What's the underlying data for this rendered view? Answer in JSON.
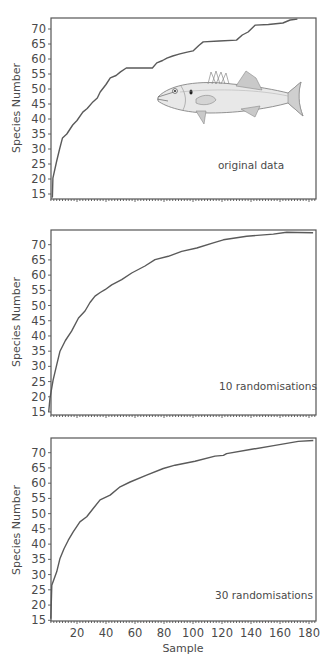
{
  "chart_data": [
    {
      "type": "line",
      "title": "",
      "annotation": "original data",
      "xlabel": "",
      "ylabel": "Species Number",
      "xlim": [
        0,
        185
      ],
      "ylim": [
        13.3,
        73.7
      ],
      "yticks": [
        15,
        20,
        25,
        30,
        35,
        40,
        45,
        50,
        55,
        60,
        65,
        70
      ],
      "xticks": [],
      "grid": false,
      "series": [
        {
          "name": "original data",
          "x": [
            2.5,
            3,
            3.4,
            6,
            8,
            10,
            13,
            17,
            20,
            24,
            27,
            31,
            34,
            36,
            40,
            43,
            47,
            50,
            54,
            60,
            66,
            72,
            75,
            79,
            82,
            86,
            91,
            96,
            100,
            104,
            107,
            118,
            130,
            134,
            138,
            143,
            152,
            162,
            167,
            172
          ],
          "y": [
            14,
            14,
            20.3,
            26,
            30,
            33.7,
            35,
            38,
            39.5,
            42.3,
            43.5,
            45.7,
            47,
            49,
            51.5,
            53.7,
            54.5,
            55.7,
            57,
            57,
            57,
            57,
            58.7,
            59.5,
            60.3,
            61,
            61.7,
            62.3,
            62.7,
            64.5,
            65.7,
            66,
            66.3,
            68,
            69,
            71.3,
            71.5,
            72,
            73,
            73.3
          ]
        }
      ],
      "illustration": "sea-bass-fish"
    },
    {
      "type": "line",
      "title": "",
      "annotation": "10 randomisations",
      "xlabel": "",
      "ylabel": "Species Number",
      "xlim": [
        0,
        185
      ],
      "ylim": [
        13.3,
        74
      ],
      "yticks": [
        15,
        20,
        25,
        30,
        35,
        40,
        45,
        50,
        55,
        60,
        65,
        70
      ],
      "xticks": [],
      "grid": false,
      "series": [
        {
          "name": "10 randomisations",
          "x": [
            0.5,
            1.4,
            3.5,
            6,
            8.3,
            12,
            16.3,
            21,
            25.5,
            29,
            32.4,
            36,
            39.3,
            43.9,
            50.8,
            57.7,
            66.9,
            73.8,
            83,
            92.2,
            102.6,
            114,
            121,
            137,
            155.4,
            164.6,
            172,
            182.8
          ],
          "y": [
            15,
            19.6,
            25.5,
            30.5,
            35,
            38.5,
            41.6,
            45.9,
            48.2,
            51,
            53.1,
            54.3,
            55.2,
            56.8,
            58.5,
            60.7,
            63,
            65.1,
            66.2,
            67.8,
            68.9,
            70.6,
            71.6,
            72.8,
            73.5,
            74.1,
            74,
            73.9
          ]
        }
      ]
    },
    {
      "type": "line",
      "title": "",
      "annotation": "30 randomisations",
      "xlabel": "Sample",
      "ylabel": "Species Number",
      "xlim": [
        0,
        185
      ],
      "ylim": [
        14.7,
        74.5
      ],
      "yticks": [
        15,
        20,
        25,
        30,
        35,
        40,
        45,
        50,
        55,
        60,
        65,
        70
      ],
      "xticks": [
        20,
        40,
        60,
        80,
        100,
        120,
        140,
        160,
        180
      ],
      "grid": false,
      "series": [
        {
          "name": "30 randomisations",
          "x": [
            1.9,
            2.6,
            6,
            8.3,
            11,
            14,
            17.4,
            22,
            26.7,
            31.2,
            35.9,
            42.8,
            49.7,
            56.6,
            68,
            79.5,
            87.6,
            101.4,
            115.2,
            121,
            123.2,
            140.5,
            156.6,
            172.6,
            183
          ],
          "y": [
            15.5,
            26.5,
            30.9,
            35.3,
            38.5,
            41.3,
            44,
            47.3,
            49,
            51.7,
            54.5,
            56.1,
            58.8,
            60.4,
            62.6,
            64.8,
            65.9,
            67.2,
            68.9,
            69.1,
            69.7,
            71.1,
            72.4,
            73.7,
            74
          ]
        }
      ]
    }
  ],
  "panels": [
    {
      "annotation": "original data",
      "ylabel": "Species Number"
    },
    {
      "annotation": "10 randomisations",
      "ylabel": "Species Number"
    },
    {
      "annotation": "30 randomisations",
      "ylabel": "Species Number"
    }
  ],
  "x_axis_title": "Sample",
  "colors": {
    "line": "#5a5a5a",
    "frame": "#555555",
    "text": "#4a4a4a",
    "background": "#ffffff"
  }
}
